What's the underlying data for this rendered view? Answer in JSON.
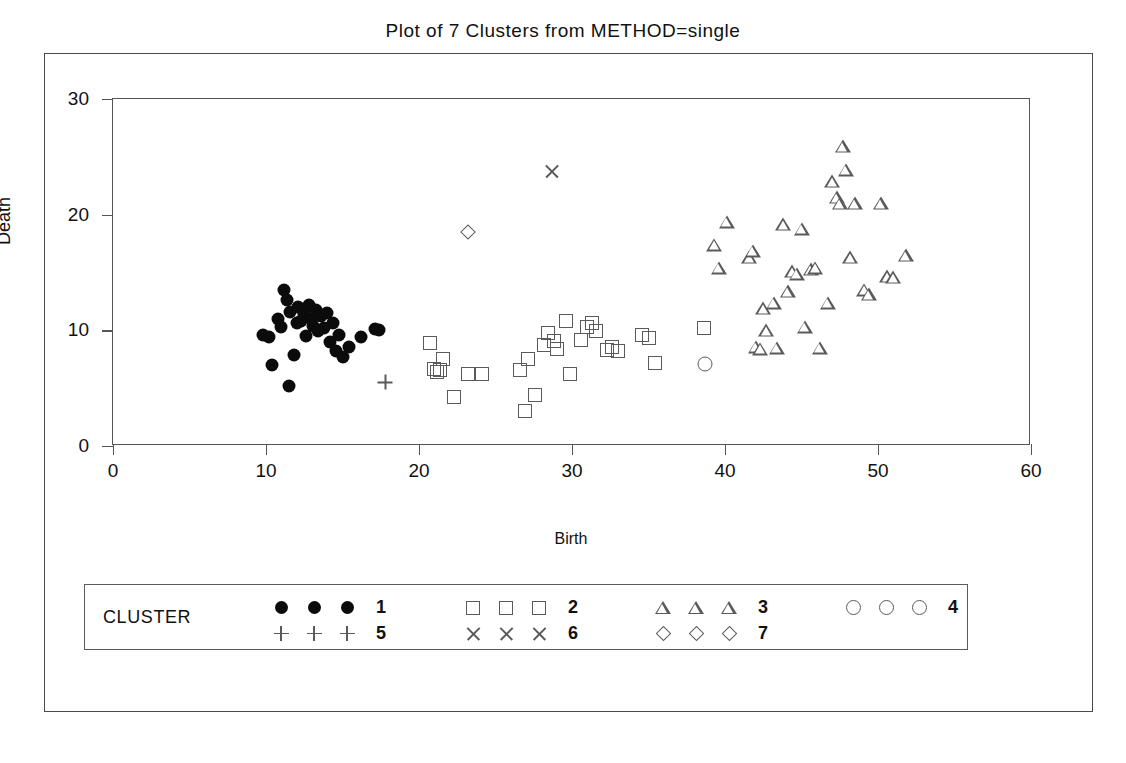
{
  "chart_data": {
    "type": "scatter",
    "title": "Plot of 7 Clusters from METHOD=single",
    "xlabel": "Birth",
    "ylabel": "Death",
    "xlim": [
      0,
      60
    ],
    "ylim": [
      0,
      30
    ],
    "xticks": [
      "0",
      "10",
      "20",
      "30",
      "40",
      "50",
      "60"
    ],
    "yticks": [
      "0",
      "10",
      "20",
      "30"
    ],
    "grid": false,
    "legend_title": "CLUSTER",
    "legend_position": "bottom",
    "series": [
      {
        "name": "1",
        "marker": "filled-circle",
        "points": [
          [
            9.8,
            9.6
          ],
          [
            10.2,
            9.4
          ],
          [
            10.4,
            7.0
          ],
          [
            10.8,
            11.0
          ],
          [
            11.0,
            10.3
          ],
          [
            11.2,
            13.5
          ],
          [
            11.4,
            12.6
          ],
          [
            11.5,
            5.2
          ],
          [
            11.6,
            11.6
          ],
          [
            11.8,
            7.9
          ],
          [
            12.0,
            10.6
          ],
          [
            12.1,
            12.0
          ],
          [
            12.3,
            10.8
          ],
          [
            12.5,
            11.4
          ],
          [
            12.6,
            9.5
          ],
          [
            12.8,
            12.2
          ],
          [
            13.0,
            11.0
          ],
          [
            13.1,
            10.4
          ],
          [
            13.3,
            11.8
          ],
          [
            13.4,
            9.9
          ],
          [
            13.6,
            11.2
          ],
          [
            13.8,
            10.2
          ],
          [
            14.0,
            11.5
          ],
          [
            14.2,
            9.0
          ],
          [
            14.4,
            10.6
          ],
          [
            14.6,
            8.2
          ],
          [
            14.8,
            9.6
          ],
          [
            15.0,
            7.7
          ],
          [
            15.4,
            8.6
          ],
          [
            16.2,
            9.4
          ],
          [
            17.1,
            10.1
          ],
          [
            17.4,
            10.0
          ]
        ]
      },
      {
        "name": "2",
        "marker": "open-square",
        "points": [
          [
            20.7,
            8.9
          ],
          [
            21.0,
            6.7
          ],
          [
            21.2,
            6.4
          ],
          [
            21.4,
            6.6
          ],
          [
            21.6,
            7.5
          ],
          [
            22.3,
            4.2
          ],
          [
            23.2,
            6.2
          ],
          [
            24.1,
            6.2
          ],
          [
            26.6,
            6.6
          ],
          [
            26.9,
            3.0
          ],
          [
            27.1,
            7.5
          ],
          [
            27.6,
            4.4
          ],
          [
            28.2,
            8.7
          ],
          [
            28.4,
            9.8
          ],
          [
            28.8,
            9.1
          ],
          [
            29.0,
            8.4
          ],
          [
            29.6,
            10.8
          ],
          [
            29.9,
            6.2
          ],
          [
            30.6,
            9.2
          ],
          [
            31.0,
            10.3
          ],
          [
            31.3,
            10.6
          ],
          [
            31.6,
            9.9
          ],
          [
            32.3,
            8.3
          ],
          [
            32.6,
            8.6
          ],
          [
            33.0,
            8.2
          ],
          [
            34.6,
            9.6
          ],
          [
            35.0,
            9.3
          ],
          [
            35.4,
            7.2
          ],
          [
            38.6,
            10.2
          ]
        ]
      },
      {
        "name": "3",
        "marker": "open-triangle",
        "points": [
          [
            39.3,
            17.4
          ],
          [
            39.6,
            15.4
          ],
          [
            40.1,
            19.4
          ],
          [
            41.6,
            16.3
          ],
          [
            41.8,
            16.9
          ],
          [
            42.0,
            8.6
          ],
          [
            42.3,
            8.4
          ],
          [
            42.5,
            11.9
          ],
          [
            42.7,
            10.0
          ],
          [
            43.2,
            12.4
          ],
          [
            43.4,
            8.5
          ],
          [
            43.8,
            19.2
          ],
          [
            44.1,
            13.4
          ],
          [
            44.4,
            15.1
          ],
          [
            44.7,
            14.9
          ],
          [
            45.0,
            18.8
          ],
          [
            45.2,
            10.3
          ],
          [
            45.6,
            15.3
          ],
          [
            45.9,
            15.4
          ],
          [
            46.2,
            8.5
          ],
          [
            46.7,
            12.4
          ],
          [
            47.0,
            22.9
          ],
          [
            47.3,
            21.5
          ],
          [
            47.5,
            21.0
          ],
          [
            47.7,
            25.9
          ],
          [
            47.9,
            23.9
          ],
          [
            48.2,
            16.3
          ],
          [
            48.5,
            21.0
          ],
          [
            49.1,
            13.5
          ],
          [
            49.4,
            13.1
          ],
          [
            50.2,
            21.0
          ],
          [
            50.6,
            14.7
          ],
          [
            51.0,
            14.6
          ],
          [
            51.8,
            16.5
          ]
        ]
      },
      {
        "name": "4",
        "marker": "open-circle",
        "points": [
          [
            38.7,
            7.1
          ]
        ]
      },
      {
        "name": "5",
        "marker": "plus",
        "points": [
          [
            17.8,
            5.5
          ]
        ]
      },
      {
        "name": "6",
        "marker": "x",
        "points": [
          [
            28.7,
            23.8
          ]
        ]
      },
      {
        "name": "7",
        "marker": "diamond",
        "points": [
          [
            23.2,
            18.5
          ]
        ]
      }
    ]
  },
  "legend": {
    "title": "CLUSTER",
    "entries": [
      {
        "label": "1",
        "marker": "filled-circle",
        "row": 0,
        "col": 0
      },
      {
        "label": "2",
        "marker": "open-square",
        "row": 0,
        "col": 1
      },
      {
        "label": "3",
        "marker": "open-triangle",
        "row": 0,
        "col": 2
      },
      {
        "label": "4",
        "marker": "open-circle",
        "row": 0,
        "col": 3
      },
      {
        "label": "5",
        "marker": "plus",
        "row": 1,
        "col": 0
      },
      {
        "label": "6",
        "marker": "x",
        "row": 1,
        "col": 1
      },
      {
        "label": "7",
        "marker": "diamond",
        "row": 1,
        "col": 2
      }
    ]
  },
  "colors": {
    "marker_outline": "#5a5a5a",
    "marker_fill": "#0b0b0b",
    "frame": "#555555",
    "text": "#111111",
    "background": "#ffffff"
  }
}
